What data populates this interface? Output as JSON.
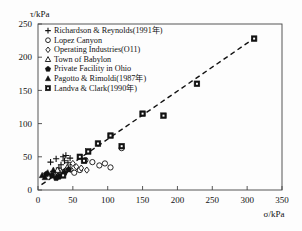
{
  "chart_data": {
    "type": "scatter",
    "title": "",
    "xlabel": "σ/kPa",
    "ylabel": "τ/kPa",
    "xlim": [
      0,
      350
    ],
    "ylim": [
      0,
      250
    ],
    "xticks": [
      0,
      50,
      100,
      150,
      200,
      250,
      300,
      350
    ],
    "yticks": [
      0,
      50,
      100,
      150,
      200,
      250
    ],
    "grid": false,
    "legend_position": "upper-left",
    "trendline": {
      "style": "dashed",
      "x": [
        5,
        315
      ],
      "y": [
        8,
        232
      ]
    },
    "series": [
      {
        "name": "Richardson & Reynolds(1991年)",
        "marker": "plus",
        "values": [
          [
            18,
            42
          ],
          [
            26,
            47
          ],
          [
            33,
            38
          ],
          [
            36,
            50
          ],
          [
            38,
            44
          ],
          [
            40,
            52
          ],
          [
            43,
            41
          ],
          [
            46,
            48
          ],
          [
            30,
            33
          ],
          [
            22,
            28
          ]
        ]
      },
      {
        "name": "Lopez Canyon",
        "marker": "circle-open",
        "values": [
          [
            78,
            42
          ],
          [
            88,
            37
          ],
          [
            96,
            40
          ],
          [
            104,
            34
          ],
          [
            120,
            63
          ],
          [
            68,
            45
          ],
          [
            60,
            30
          ],
          [
            52,
            26
          ]
        ]
      },
      {
        "name": "Operating Industries(O11)",
        "marker": "diamond-open",
        "values": [
          [
            40,
            28
          ],
          [
            47,
            31
          ],
          [
            55,
            35
          ],
          [
            62,
            33
          ],
          [
            70,
            30
          ],
          [
            34,
            24
          ],
          [
            50,
            40
          ]
        ]
      },
      {
        "name": "Town of Babylon",
        "marker": "triangle-open",
        "values": [
          [
            28,
            30
          ],
          [
            34,
            27
          ],
          [
            42,
            34
          ],
          [
            24,
            22
          ]
        ]
      },
      {
        "name": "Private Facility in Ohio",
        "marker": "pentagon-filled",
        "values": [
          [
            12,
            24
          ],
          [
            20,
            22
          ],
          [
            30,
            20
          ],
          [
            38,
            26
          ],
          [
            44,
            31
          ],
          [
            26,
            18
          ]
        ]
      },
      {
        "name": "Pagotto & Rimoldi(1987年)",
        "marker": "triangle-filled",
        "values": [
          [
            6,
            22
          ],
          [
            14,
            26
          ],
          [
            22,
            30
          ],
          [
            10,
            19
          ]
        ]
      },
      {
        "name": "Landva & Clark(1990年)",
        "marker": "square-filled",
        "values": [
          [
            36,
            22
          ],
          [
            60,
            50
          ],
          [
            72,
            58
          ],
          [
            86,
            70
          ],
          [
            104,
            82
          ],
          [
            120,
            66
          ],
          [
            150,
            115
          ],
          [
            180,
            112
          ],
          [
            228,
            160
          ],
          [
            310,
            228
          ],
          [
            66,
            44
          ]
        ]
      }
    ]
  },
  "legend": {
    "entries": [
      {
        "marker": "plus",
        "label": "Richardson & Reynolds(1991年)"
      },
      {
        "marker": "circle-open",
        "label": "Lopez Canyon"
      },
      {
        "marker": "diamond-open",
        "label": "Operating Industries(O11)"
      },
      {
        "marker": "triangle-open",
        "label": "Town of Babylon"
      },
      {
        "marker": "pentagon-filled",
        "label": "Private Facility in Ohio"
      },
      {
        "marker": "triangle-filled",
        "label": "Pagotto & Rimoldi(1987年)"
      },
      {
        "marker": "square-filled",
        "label": "Landva & Clark(1990年)"
      }
    ]
  },
  "colors": {
    "ink": "#111111",
    "frame": "#444444",
    "background": "#fdfdfd"
  }
}
